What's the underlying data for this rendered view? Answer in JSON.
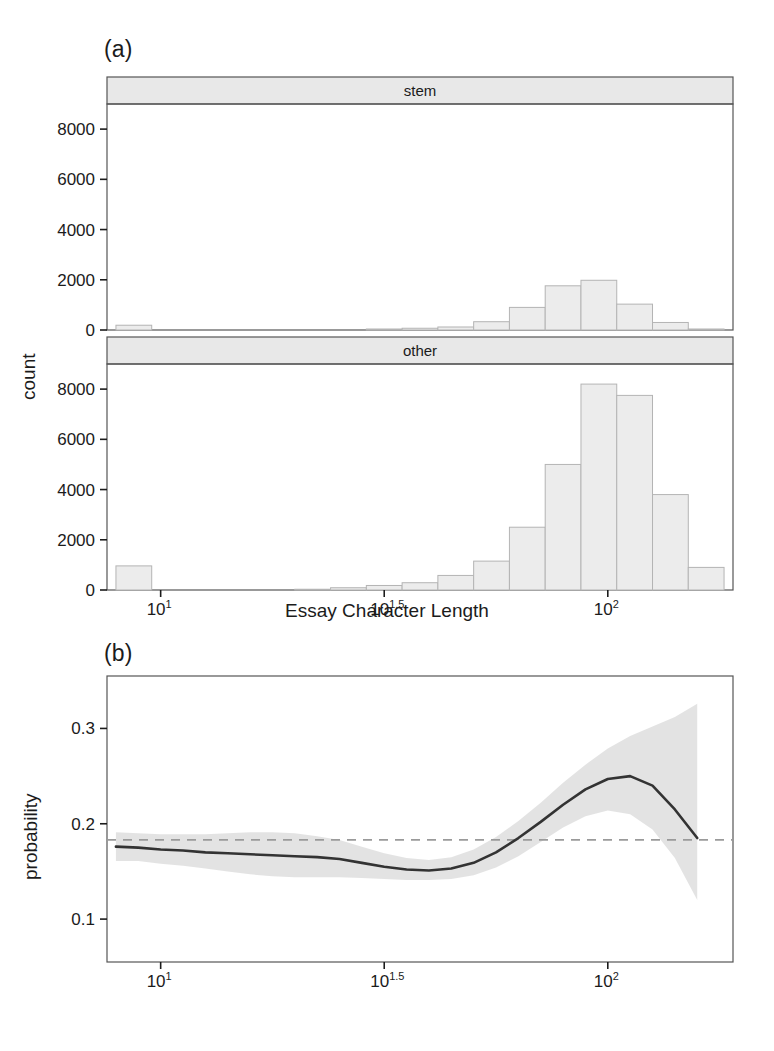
{
  "figure": {
    "panel_a_tag": "(a)",
    "panel_b_tag": "(b)",
    "x_axis_title": "Essay Character Length",
    "y_axis_title_a": "count",
    "y_axis_title_b": "probability"
  },
  "chart_data": [
    {
      "type": "bar",
      "panel": "(a)",
      "title": "",
      "xlabel": "Essay Character Length",
      "ylabel": "count",
      "xscale": "log10",
      "xlim": [
        0.88,
        2.28
      ],
      "ylim": [
        0,
        9000
      ],
      "ytick_values": [
        0,
        2000,
        4000,
        6000,
        8000
      ],
      "ytick_labels": [
        "0",
        "2000",
        "4000",
        "6000",
        "8000"
      ],
      "xtick_values": [
        0,
        0.5,
        1.0,
        1.5,
        2.0
      ],
      "xtick_labels": [
        "10^0",
        "10^0.5",
        "10^1",
        "10^1.5",
        "10^2"
      ],
      "xtick_mantissa": [
        "10",
        "10",
        "10",
        "10",
        "10"
      ],
      "xtick_exponent": [
        "0",
        "0.5",
        "1",
        "1.5",
        "2"
      ],
      "grid": false,
      "legend": "none",
      "facets": [
        {
          "strip_label": "stem",
          "bin_left_log10": [
            0.9,
            0.98,
            1.06,
            1.14,
            1.22,
            1.3,
            1.38,
            1.46,
            1.54,
            1.62,
            1.7,
            1.78,
            1.86,
            1.94,
            2.02,
            2.1,
            2.18
          ],
          "bin_width_log10": 0.08,
          "values": [
            190,
            0,
            0,
            0,
            0,
            0,
            0,
            40,
            70,
            120,
            330,
            900,
            1760,
            1980,
            1030,
            300,
            40
          ]
        },
        {
          "strip_label": "other",
          "bin_left_log10": [
            0.9,
            0.98,
            1.06,
            1.14,
            1.22,
            1.3,
            1.38,
            1.46,
            1.54,
            1.62,
            1.7,
            1.78,
            1.86,
            1.94,
            2.02,
            2.1,
            2.18
          ],
          "bin_width_log10": 0.08,
          "values": [
            960,
            0,
            0,
            0,
            0,
            30,
            90,
            180,
            290,
            580,
            1150,
            2500,
            5000,
            8200,
            7750,
            3800,
            900,
            200,
            40
          ]
        }
      ]
    },
    {
      "type": "line",
      "panel": "(b)",
      "title": "",
      "xlabel": "",
      "ylabel": "probability",
      "xscale": "log10",
      "xlim": [
        0.88,
        2.28
      ],
      "ylim": [
        0.055,
        0.355
      ],
      "ytick_values": [
        0.1,
        0.2,
        0.3
      ],
      "ytick_labels": [
        "0.1",
        "0.2",
        "0.3"
      ],
      "xtick_values": [
        0,
        0.5,
        1.0,
        1.5,
        2.0
      ],
      "xtick_labels": [
        "10^0",
        "10^0.5",
        "10^1",
        "10^1.5",
        "10^2"
      ],
      "xtick_mantissa": [
        "10",
        "10",
        "10",
        "10",
        "10"
      ],
      "xtick_exponent": [
        "0",
        "0.5",
        "1",
        "1.5",
        "2"
      ],
      "grid": false,
      "legend": "none",
      "reference_line": {
        "style": "dashed",
        "y": 0.183,
        "color": "#9a9a9a"
      },
      "series": [
        {
          "name": "fitted probability",
          "color": "#333333",
          "x": [
            0.9,
            0.95,
            1.0,
            1.05,
            1.1,
            1.15,
            1.2,
            1.25,
            1.3,
            1.35,
            1.4,
            1.45,
            1.5,
            1.55,
            1.6,
            1.65,
            1.7,
            1.75,
            1.8,
            1.85,
            1.9,
            1.95,
            2.0,
            2.05,
            2.1,
            2.15,
            2.2
          ],
          "y": [
            0.176,
            0.175,
            0.173,
            0.172,
            0.17,
            0.169,
            0.168,
            0.167,
            0.166,
            0.165,
            0.163,
            0.159,
            0.155,
            0.152,
            0.151,
            0.153,
            0.159,
            0.17,
            0.185,
            0.202,
            0.22,
            0.236,
            0.247,
            0.25,
            0.24,
            0.215,
            0.185,
            0.162
          ]
        }
      ],
      "confidence_band": {
        "color": "#e2e2e2",
        "x": [
          0.9,
          0.95,
          1.0,
          1.05,
          1.1,
          1.15,
          1.2,
          1.25,
          1.3,
          1.35,
          1.4,
          1.45,
          1.5,
          1.55,
          1.6,
          1.65,
          1.7,
          1.75,
          1.8,
          1.85,
          1.9,
          1.95,
          2.0,
          2.05,
          2.1,
          2.15,
          2.2
        ],
        "upper": [
          0.191,
          0.19,
          0.189,
          0.189,
          0.189,
          0.19,
          0.191,
          0.191,
          0.19,
          0.187,
          0.183,
          0.176,
          0.169,
          0.164,
          0.162,
          0.165,
          0.173,
          0.186,
          0.203,
          0.222,
          0.243,
          0.262,
          0.279,
          0.292,
          0.302,
          0.312,
          0.326,
          0.345
        ],
        "lower": [
          0.161,
          0.161,
          0.158,
          0.156,
          0.153,
          0.15,
          0.147,
          0.145,
          0.144,
          0.144,
          0.144,
          0.143,
          0.142,
          0.141,
          0.141,
          0.142,
          0.146,
          0.154,
          0.166,
          0.181,
          0.196,
          0.208,
          0.214,
          0.21,
          0.194,
          0.164,
          0.12,
          0.062
        ]
      }
    }
  ]
}
